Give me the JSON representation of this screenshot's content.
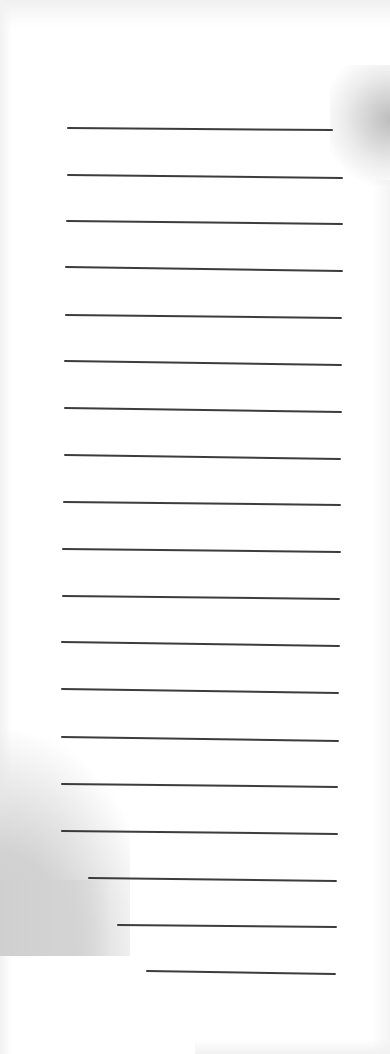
{
  "page": {
    "background_color": "#ffffff",
    "line_color": "#2b2b2b",
    "shadow_color": "#cfcfcf"
  },
  "rules": [
    {
      "x1": 67,
      "y1": 127,
      "x2": 333,
      "y2": 129
    },
    {
      "x1": 67,
      "y1": 174,
      "x2": 343,
      "y2": 177
    },
    {
      "x1": 66,
      "y1": 220,
      "x2": 343,
      "y2": 223
    },
    {
      "x1": 65,
      "y1": 266,
      "x2": 343,
      "y2": 270
    },
    {
      "x1": 65,
      "y1": 314,
      "x2": 342,
      "y2": 317
    },
    {
      "x1": 64,
      "y1": 360,
      "x2": 342,
      "y2": 364
    },
    {
      "x1": 64,
      "y1": 407,
      "x2": 342,
      "y2": 411
    },
    {
      "x1": 64,
      "y1": 454,
      "x2": 341,
      "y2": 458
    },
    {
      "x1": 63,
      "y1": 501,
      "x2": 341,
      "y2": 504
    },
    {
      "x1": 62,
      "y1": 548,
      "x2": 341,
      "y2": 551
    },
    {
      "x1": 62,
      "y1": 595,
      "x2": 340,
      "y2": 598
    },
    {
      "x1": 61,
      "y1": 641,
      "x2": 340,
      "y2": 645
    },
    {
      "x1": 61,
      "y1": 688,
      "x2": 339,
      "y2": 692
    },
    {
      "x1": 61,
      "y1": 736,
      "x2": 339,
      "y2": 740
    },
    {
      "x1": 61,
      "y1": 783,
      "x2": 338,
      "y2": 786
    },
    {
      "x1": 61,
      "y1": 830,
      "x2": 338,
      "y2": 833
    },
    {
      "x1": 88,
      "y1": 877,
      "x2": 337,
      "y2": 880
    },
    {
      "x1": 117,
      "y1": 924,
      "x2": 337,
      "y2": 926
    },
    {
      "x1": 146,
      "y1": 970,
      "x2": 336,
      "y2": 973
    }
  ]
}
